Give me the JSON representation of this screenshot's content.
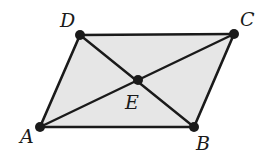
{
  "diagram": {
    "type": "parallelogram-with-diagonals",
    "fill_color": "#e6e6e6",
    "stroke_color": "#1a1a1a",
    "points": {
      "A": {
        "label": "A",
        "x": 40,
        "y": 127,
        "label_x": 20,
        "label_y": 143
      },
      "B": {
        "label": "B",
        "x": 194,
        "y": 127,
        "label_x": 196,
        "label_y": 150
      },
      "C": {
        "label": "C",
        "x": 234,
        "y": 34,
        "label_x": 240,
        "label_y": 26
      },
      "D": {
        "label": "D",
        "x": 80,
        "y": 35,
        "label_x": 60,
        "label_y": 27
      },
      "E": {
        "label": "E",
        "x": 138,
        "y": 80,
        "label_x": 125,
        "label_y": 109
      }
    },
    "edges": [
      "AB",
      "BC",
      "CD",
      "DA"
    ],
    "diagonals": [
      "AC",
      "BD"
    ],
    "intersection": "E"
  }
}
